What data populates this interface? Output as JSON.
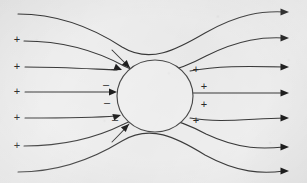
{
  "figure": {
    "width": 307,
    "height": 183,
    "background_color": "#efefef",
    "stroke_color": "#3a3a3a",
    "sign_color": "#2b2b2b"
  },
  "sphere": {
    "label": "conducting-sphere",
    "center_x": 155,
    "center_y": 96,
    "radius_x": 38,
    "radius_y": 36,
    "fill": "#f2f2f2",
    "stroke": "#4a4a4a"
  },
  "source_charges": {
    "symbol": "+",
    "count": 5,
    "font_size": 11,
    "positions": [
      {
        "x": 17,
        "y": 40
      },
      {
        "x": 17,
        "y": 67
      },
      {
        "x": 17,
        "y": 92
      },
      {
        "x": 17,
        "y": 118
      },
      {
        "x": 17,
        "y": 146
      }
    ]
  },
  "induced_negative": {
    "symbol": "–",
    "count": 4,
    "font_size": 11,
    "positions": [
      {
        "x": 114,
        "y": 69
      },
      {
        "x": 106,
        "y": 85
      },
      {
        "x": 107,
        "y": 103
      },
      {
        "x": 115,
        "y": 120
      }
    ]
  },
  "induced_positive": {
    "symbol": "+",
    "count": 4,
    "font_size": 11,
    "positions": [
      {
        "x": 196,
        "y": 70
      },
      {
        "x": 204,
        "y": 87
      },
      {
        "x": 204,
        "y": 105
      },
      {
        "x": 196,
        "y": 121
      }
    ]
  },
  "field_lines": [
    {
      "name": "field-line-1",
      "path": "M 18 14 C 60 14 96 30 122 47 C 150 64 176 50 205 33 C 238 14 262 11 284 12",
      "start": {
        "x": 18,
        "y": 14
      },
      "end": {
        "x": 284,
        "y": 12
      },
      "has_end_arrow": true,
      "has_sphere_arrow": false
    },
    {
      "name": "field-line-2",
      "path": "M 24 41 C 66 41 100 53 124 66 C 150 80 178 71 206 56 C 240 39 264 37 284 38",
      "start": {
        "x": 24,
        "y": 41
      },
      "end": {
        "x": 284,
        "y": 38
      },
      "has_end_arrow": true,
      "has_sphere_arrow": false
    },
    {
      "name": "field-line-3",
      "path": "M 25 67 C 62 67 92 69 117 70",
      "start": {
        "x": 25,
        "y": 67
      },
      "end": {
        "x": 117,
        "y": 70
      },
      "has_end_arrow": false,
      "has_sphere_arrow": true,
      "sphere_arrow": {
        "x": 122,
        "y": 70,
        "angle": 22
      }
    },
    {
      "name": "field-line-3b",
      "path": "M 190 71 C 216 66 244 66 284 67",
      "start": {
        "x": 190,
        "y": 71
      },
      "end": {
        "x": 284,
        "y": 67
      },
      "has_end_arrow": true,
      "has_sphere_arrow": false
    },
    {
      "name": "field-line-4",
      "path": "M 25 92 C 58 92 88 92 112 92",
      "start": {
        "x": 25,
        "y": 92
      },
      "end": {
        "x": 112,
        "y": 92
      },
      "has_end_arrow": false,
      "has_sphere_arrow": true,
      "sphere_arrow": {
        "x": 117,
        "y": 92,
        "angle": 0
      }
    },
    {
      "name": "field-line-4b",
      "path": "M 193 93 C 222 93 252 93 284 93",
      "start": {
        "x": 193,
        "y": 93
      },
      "end": {
        "x": 284,
        "y": 93
      },
      "has_end_arrow": true,
      "has_sphere_arrow": false
    },
    {
      "name": "field-line-5",
      "path": "M 25 118 C 62 118 92 118 116 116",
      "start": {
        "x": 25,
        "y": 118
      },
      "end": {
        "x": 116,
        "y": 116
      },
      "has_end_arrow": false,
      "has_sphere_arrow": true,
      "sphere_arrow": {
        "x": 121,
        "y": 115,
        "angle": -16
      }
    },
    {
      "name": "field-line-5b",
      "path": "M 190 118 C 218 123 246 119 284 118",
      "start": {
        "x": 190,
        "y": 118
      },
      "end": {
        "x": 284,
        "y": 118
      },
      "has_end_arrow": true,
      "has_sphere_arrow": false
    },
    {
      "name": "field-line-6",
      "path": "M 24 146 C 66 146 100 136 124 124 C 150 110 178 119 206 134 C 240 150 264 149 284 147",
      "start": {
        "x": 24,
        "y": 146
      },
      "end": {
        "x": 284,
        "y": 147
      },
      "has_end_arrow": true,
      "has_sphere_arrow": false
    },
    {
      "name": "field-line-7",
      "path": "M 18 172 C 60 172 96 157 122 141 C 150 124 176 137 205 155 C 238 173 262 174 284 171",
      "start": {
        "x": 18,
        "y": 172
      },
      "end": {
        "x": 284,
        "y": 171
      },
      "has_end_arrow": true,
      "has_sphere_arrow": false
    },
    {
      "name": "field-line-upper-inflow",
      "path": "M 112 50 C 118 56 124 62 130 68",
      "start": {
        "x": 112,
        "y": 50
      },
      "end": {
        "x": 130,
        "y": 68
      },
      "has_end_arrow": false,
      "has_sphere_arrow": true,
      "sphere_arrow": {
        "x": 130,
        "y": 68,
        "angle": 45
      }
    },
    {
      "name": "field-line-lower-inflow",
      "path": "M 112 142 C 118 136 124 130 129 124",
      "start": {
        "x": 112,
        "y": 142
      },
      "end": {
        "x": 129,
        "y": 124
      },
      "has_end_arrow": false,
      "has_sphere_arrow": true,
      "sphere_arrow": {
        "x": 129,
        "y": 124,
        "angle": -45
      }
    }
  ],
  "end_arrows": {
    "name": "right-edge-arrowheads",
    "count": 7,
    "positions": [
      {
        "x": 289,
        "y": 12
      },
      {
        "x": 289,
        "y": 38
      },
      {
        "x": 289,
        "y": 67
      },
      {
        "x": 289,
        "y": 93
      },
      {
        "x": 289,
        "y": 118
      },
      {
        "x": 289,
        "y": 147
      },
      {
        "x": 289,
        "y": 171
      }
    ]
  }
}
